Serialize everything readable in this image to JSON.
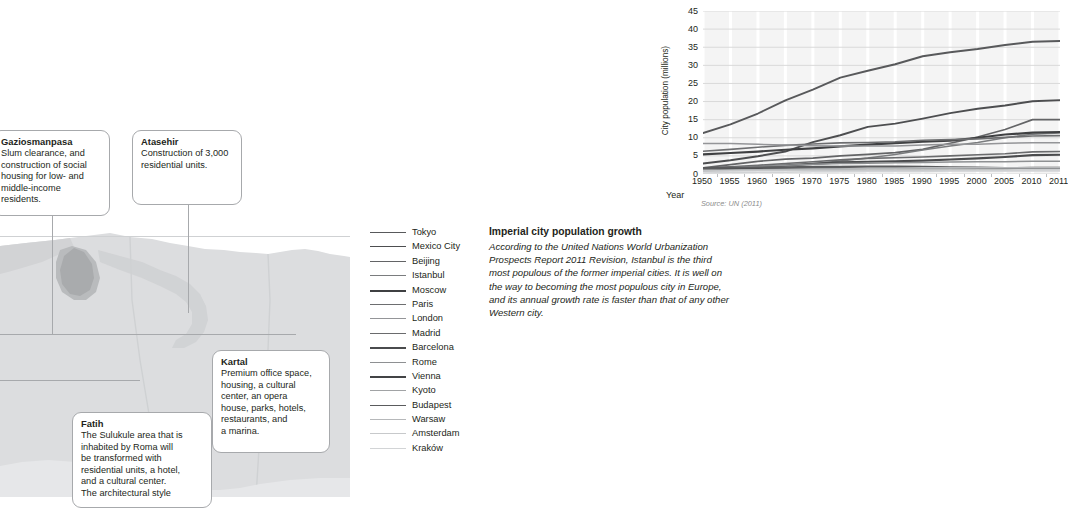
{
  "chart_data": {
    "type": "line",
    "title": "",
    "xlabel": "Year",
    "ylabel": "City population (millions)",
    "ylim": [
      0,
      45
    ],
    "yticks": [
      0,
      5,
      10,
      15,
      20,
      25,
      30,
      35,
      40,
      45
    ],
    "grid": true,
    "legend_position": "below-left",
    "source": "Source: UN (2011)",
    "categories": [
      1950,
      1955,
      1960,
      1965,
      1970,
      1975,
      1980,
      1985,
      1990,
      1995,
      2000,
      2005,
      2010,
      2011
    ],
    "series": [
      {
        "name": "Tokyo",
        "color": "#58595b",
        "width": 1.9,
        "values": [
          11.3,
          13.7,
          16.7,
          20.3,
          23.3,
          26.6,
          28.5,
          30.3,
          32.5,
          33.6,
          34.5,
          35.6,
          36.5,
          36.7
        ]
      },
      {
        "name": "Mexico City",
        "color": "#4d4e50",
        "width": 1.9,
        "values": [
          2.9,
          3.8,
          4.9,
          6.2,
          8.8,
          10.7,
          13.0,
          13.9,
          15.3,
          16.8,
          18.0,
          18.9,
          20.1,
          20.4
        ]
      },
      {
        "name": "Beijing",
        "color": "#636466",
        "width": 1.7,
        "values": [
          1.7,
          2.6,
          3.5,
          4.1,
          4.4,
          5.0,
          5.4,
          5.9,
          6.8,
          8.5,
          10.2,
          12.3,
          15.0,
          15.0
        ]
      },
      {
        "name": "Istanbul",
        "color": "#7a7c7e",
        "width": 1.5,
        "values": [
          1.0,
          1.3,
          1.7,
          2.2,
          2.8,
          3.6,
          4.4,
          5.4,
          6.6,
          7.7,
          8.7,
          10.0,
          11.0,
          11.3
        ]
      },
      {
        "name": "Moscow",
        "color": "#3f4042",
        "width": 2.2,
        "values": [
          5.4,
          5.8,
          6.2,
          6.7,
          7.1,
          7.6,
          8.1,
          8.5,
          8.9,
          9.2,
          10.0,
          10.9,
          11.4,
          11.6
        ]
      },
      {
        "name": "Paris",
        "color": "#6d6e70",
        "width": 1.6,
        "values": [
          6.3,
          6.8,
          7.4,
          7.9,
          8.3,
          8.6,
          8.7,
          8.9,
          9.3,
          9.5,
          9.7,
          10.1,
          10.5,
          10.6
        ]
      },
      {
        "name": "London",
        "color": "#949598",
        "width": 1.5,
        "values": [
          8.4,
          8.4,
          8.2,
          8.0,
          7.8,
          7.7,
          7.7,
          7.7,
          8.0,
          8.2,
          8.2,
          8.5,
          8.6,
          8.6
        ]
      },
      {
        "name": "Madrid",
        "color": "#6a6b6d",
        "width": 1.6,
        "values": [
          1.6,
          2.0,
          2.4,
          2.9,
          3.4,
          3.9,
          4.3,
          4.5,
          4.7,
          5.0,
          5.3,
          5.6,
          6.1,
          6.2
        ]
      },
      {
        "name": "Barcelona",
        "color": "#4a4b4d",
        "width": 2.1,
        "values": [
          1.6,
          1.8,
          2.0,
          2.4,
          2.8,
          3.2,
          3.4,
          3.5,
          3.7,
          4.0,
          4.3,
          4.7,
          5.2,
          5.3
        ]
      },
      {
        "name": "Rome",
        "color": "#8e9092",
        "width": 1.5,
        "values": [
          1.6,
          1.8,
          2.1,
          2.4,
          2.7,
          2.9,
          3.0,
          3.1,
          3.2,
          3.3,
          3.4,
          3.4,
          3.5,
          3.5
        ]
      },
      {
        "name": "Vienna",
        "color": "#434446",
        "width": 2.1,
        "values": [
          1.6,
          1.6,
          1.6,
          1.6,
          1.6,
          1.6,
          1.6,
          1.6,
          1.6,
          1.6,
          1.6,
          1.6,
          1.7,
          1.7
        ]
      },
      {
        "name": "Kyoto",
        "color": "#a1a3a5",
        "width": 1.5,
        "values": [
          1.0,
          1.1,
          1.2,
          1.3,
          1.4,
          1.4,
          1.5,
          1.5,
          1.5,
          1.5,
          1.5,
          1.5,
          1.5,
          1.5
        ]
      },
      {
        "name": "Budapest",
        "color": "#5a5b5d",
        "width": 1.9,
        "values": [
          1.6,
          1.7,
          1.8,
          1.9,
          2.0,
          2.0,
          2.1,
          2.1,
          2.0,
          1.9,
          1.8,
          1.7,
          1.7,
          1.7
        ]
      },
      {
        "name": "Warsaw",
        "color": "#b6b8ba",
        "width": 1.5,
        "values": [
          0.8,
          1.0,
          1.1,
          1.2,
          1.3,
          1.4,
          1.6,
          1.6,
          1.7,
          1.7,
          1.7,
          1.7,
          1.7,
          1.7
        ]
      },
      {
        "name": "Amsterdam",
        "color": "#c7c9cb",
        "width": 1.5,
        "values": [
          0.8,
          0.9,
          1.0,
          1.0,
          1.0,
          1.0,
          1.0,
          1.0,
          1.0,
          1.0,
          1.0,
          1.0,
          1.1,
          1.1
        ]
      },
      {
        "name": "Kraków",
        "color": "#d2d4d6",
        "width": 1.5,
        "values": [
          0.3,
          0.4,
          0.5,
          0.5,
          0.6,
          0.6,
          0.7,
          0.7,
          0.7,
          0.8,
          0.8,
          0.8,
          0.8,
          0.8
        ]
      }
    ]
  },
  "sidetext": {
    "heading": "Imperial city population growth",
    "body": "According to the United Nations World Urbanization Prospects Report 2011 Revision, Istanbul is the third most populous of the former imperial cities. It is well on the way to becoming the most populous city in Europe, and its annual growth rate is faster than that of any other Western city."
  },
  "callouts": [
    {
      "id": "gaziosmanpasa",
      "title": "Gaziosmanpasa",
      "body": "Slum clearance, and\nconstruction of social\nhousing for low- and\nmiddle-income residents."
    },
    {
      "id": "atasehir",
      "title": "Atasehir",
      "body": "Construction of 3,000\nresidential units."
    },
    {
      "id": "kartal",
      "title": "Kartal",
      "body": "Premium office space,\nhousing, a cultural\ncenter, an opera\nhouse, parks, hotels,\nrestaurants, and\na marina."
    },
    {
      "id": "fatih",
      "title": "Fatih",
      "body": "The Sulukule area that is\ninhabited by Roma will\nbe transformed with\nresidential units, a hotel,\nand a cultural center.\nThe architectural style"
    }
  ]
}
